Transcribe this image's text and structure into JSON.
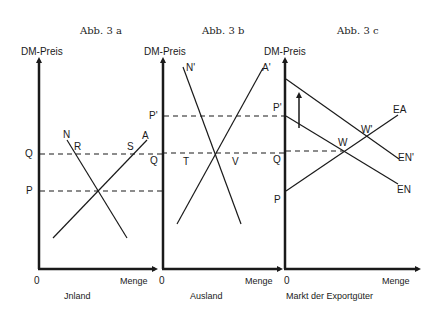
{
  "panels": [
    {
      "id": "3a",
      "title": "Abb. 3 a",
      "y_axis_label": "DM-Preis",
      "x_axis_label": "Menge",
      "origin_label": "0",
      "caption": "Jnland",
      "price_levels": [
        {
          "label": "Q",
          "role": "upper price"
        },
        {
          "label": "P",
          "role": "equilibrium price"
        }
      ],
      "curves": [
        {
          "label": "N",
          "type": "demand",
          "direction": "downward"
        },
        {
          "label": "A",
          "type": "supply",
          "direction": "upward"
        }
      ],
      "points": [
        {
          "label": "R",
          "on": "N at price Q"
        },
        {
          "label": "S",
          "on": "A at price Q"
        }
      ]
    },
    {
      "id": "3b",
      "title": "Abb. 3 b",
      "y_axis_label": "DM-Preis",
      "x_axis_label": "Menge",
      "origin_label": "0",
      "caption": "Ausland",
      "price_levels": [
        {
          "label": "P'",
          "role": "equilibrium price"
        },
        {
          "label": "Q",
          "role": "lower price"
        }
      ],
      "curves": [
        {
          "label": "N'",
          "type": "demand",
          "direction": "downward"
        },
        {
          "label": "A'",
          "type": "supply",
          "direction": "upward"
        }
      ],
      "points": [
        {
          "label": "T",
          "on": "A' at price Q"
        },
        {
          "label": "V",
          "on": "N' at price Q"
        }
      ]
    },
    {
      "id": "3c",
      "title": "Abb. 3 c",
      "y_axis_label": "DM-Preis",
      "x_axis_label": "Menge",
      "origin_label": "0",
      "caption": "Markt der Exportgüter",
      "price_levels": [
        {
          "label": "P'",
          "role": "intercept EN"
        },
        {
          "label": "Q",
          "role": "equilibrium price W"
        },
        {
          "label": "P",
          "role": "intercept EA"
        }
      ],
      "curves": [
        {
          "label": "EA",
          "type": "export supply",
          "direction": "upward"
        },
        {
          "label": "EN",
          "type": "export demand",
          "direction": "downward"
        },
        {
          "label": "EN'",
          "type": "shifted export demand",
          "direction": "downward"
        }
      ],
      "points": [
        {
          "label": "W",
          "on": "EA ∩ EN"
        },
        {
          "label": "W'",
          "on": "EA ∩ EN'"
        }
      ],
      "annotations": [
        {
          "type": "up-arrow",
          "meaning": "demand shift upward"
        }
      ]
    }
  ],
  "labels": {
    "title_a": "Abb. 3 a",
    "title_b": "Abb. 3 b",
    "title_c": "Abb. 3 c",
    "ylabel": "DM-Preis",
    "xlabel": "Menge",
    "origin": "0",
    "caption_a": "Jnland",
    "caption_b": "Ausland",
    "caption_c": "Markt der Exportgüter",
    "a_Q": "Q",
    "a_P": "P",
    "a_N": "N",
    "a_A": "A",
    "a_R": "R",
    "a_S": "S",
    "b_Pp": "P'",
    "b_Q": "Q",
    "b_Np": "N'",
    "b_Ap": "A'",
    "b_T": "T",
    "b_V": "V",
    "c_Pp": "P'",
    "c_Q": "Q",
    "c_P": "P",
    "c_EA": "EA",
    "c_EN": "EN",
    "c_ENp": "EN'",
    "c_W": "W",
    "c_Wp": "W'"
  },
  "colors": {
    "ink": "#1a1a1a",
    "background": "#ffffff"
  }
}
